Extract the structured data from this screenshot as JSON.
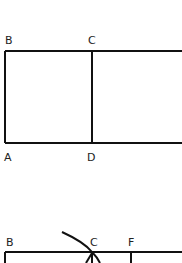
{
  "figure_top": {
    "labels": {
      "b": "B",
      "c": "C",
      "a": "A",
      "d": "D"
    }
  },
  "figure_bottom": {
    "labels": {
      "b": "B",
      "c": "C",
      "f": "F"
    }
  },
  "colors": {
    "line": "#111111",
    "background": "#ffffff"
  }
}
